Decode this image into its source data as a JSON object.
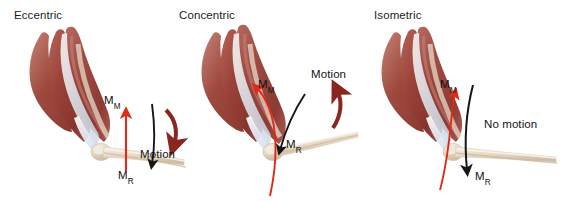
{
  "figure": {
    "background_color": "#ffffff",
    "width": 562,
    "height": 201
  },
  "colors": {
    "muscle_dark": "#8e3a32",
    "muscle_mid": "#a04a40",
    "muscle_light": "#c07a6e",
    "tendon": "#e8eef5",
    "bone": "#e9ded0",
    "bone_shade": "#d2c3ae",
    "arrow_red": "#e02a18",
    "arrow_black": "#161616",
    "arrow_maroon": "#8a2520",
    "text": "#1d1d1d"
  },
  "panels": [
    {
      "id": "eccentric",
      "title": "Eccentric",
      "muscle_force_label": "M",
      "muscle_force_sub": "M",
      "resistance_label": "M",
      "resistance_sub": "R",
      "motion_label": "Motion",
      "muscle_arrow_color": "#e02a18",
      "muscle_arrow_direction": "up",
      "resistance_arrow_color": "#161616",
      "resistance_arrow_direction": "down",
      "motion_arrow_color": "#8a2520",
      "motion_arrow_direction": "clockwise-down"
    },
    {
      "id": "concentric",
      "title": "Concentric",
      "muscle_force_label": "M",
      "muscle_force_sub": "M",
      "resistance_label": "M",
      "resistance_sub": "R",
      "motion_label": "Motion",
      "muscle_arrow_color": "#e02a18",
      "muscle_arrow_direction": "up-left-curved",
      "resistance_arrow_color": "#161616",
      "resistance_arrow_direction": "down-right-curved",
      "motion_arrow_color": "#8a2520",
      "motion_arrow_direction": "counter-clockwise-up"
    },
    {
      "id": "isometric",
      "title": "Isometric",
      "muscle_force_label": "M",
      "muscle_force_sub": "M",
      "resistance_label": "M",
      "resistance_sub": "R",
      "motion_label": "No motion",
      "muscle_arrow_color": "#e02a18",
      "muscle_arrow_direction": "up",
      "resistance_arrow_color": "#161616",
      "resistance_arrow_direction": "down",
      "motion_arrow_color": null,
      "motion_arrow_direction": "none"
    }
  ]
}
